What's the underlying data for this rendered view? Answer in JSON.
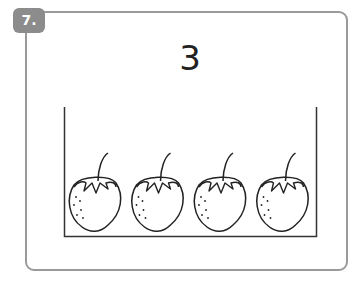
{
  "exercise": {
    "number_label": "7.",
    "target_number": "3",
    "objects": {
      "kind": "strawberry",
      "count": 4
    },
    "colors": {
      "badge": "#8c8c8c",
      "border": "#9a9a9a",
      "ink": "#222222"
    }
  }
}
